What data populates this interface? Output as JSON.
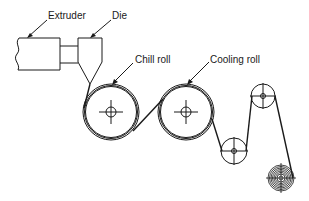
{
  "diagram": {
    "labels": {
      "extruder": "Extruder",
      "die": "Die",
      "chill_roll": "Chill roll",
      "cooling_roll": "Cooling roll"
    },
    "components": [
      {
        "id": "extruder",
        "label": "Extruder"
      },
      {
        "id": "die",
        "label": "Die"
      },
      {
        "id": "chill-roll",
        "label": "Chill roll"
      },
      {
        "id": "cooling-roll",
        "label": "Cooling roll"
      },
      {
        "id": "idler-roll-lower",
        "label": ""
      },
      {
        "id": "idler-roll-upper",
        "label": ""
      },
      {
        "id": "wind-up-roll",
        "label": ""
      }
    ],
    "colors": {
      "line": "#1a1a1a",
      "background": "#ffffff"
    }
  }
}
